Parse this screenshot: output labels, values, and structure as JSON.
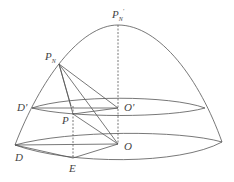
{
  "diagram": {
    "type": "geometry-figure",
    "stroke_color": "#555555",
    "labels": {
      "pn_prime": "P",
      "pn_prime_sub": "N",
      "pn_prime_sup": "'",
      "pn": "P",
      "pn_sub": "N",
      "d_prime": "D'",
      "o_prime": "O'",
      "p": "P",
      "d": "D",
      "o": "O",
      "e": "E"
    },
    "points": {
      "PN_prime": [
        118,
        25
      ],
      "PN": [
        59,
        64
      ],
      "D_prime": [
        32,
        108
      ],
      "O_prime": [
        118,
        108
      ],
      "upper_right": [
        205,
        108
      ],
      "P": [
        73,
        114
      ],
      "D": [
        15,
        145
      ],
      "O": [
        118,
        144
      ],
      "E": [
        73,
        158
      ],
      "lower_right": [
        222,
        142
      ]
    }
  }
}
